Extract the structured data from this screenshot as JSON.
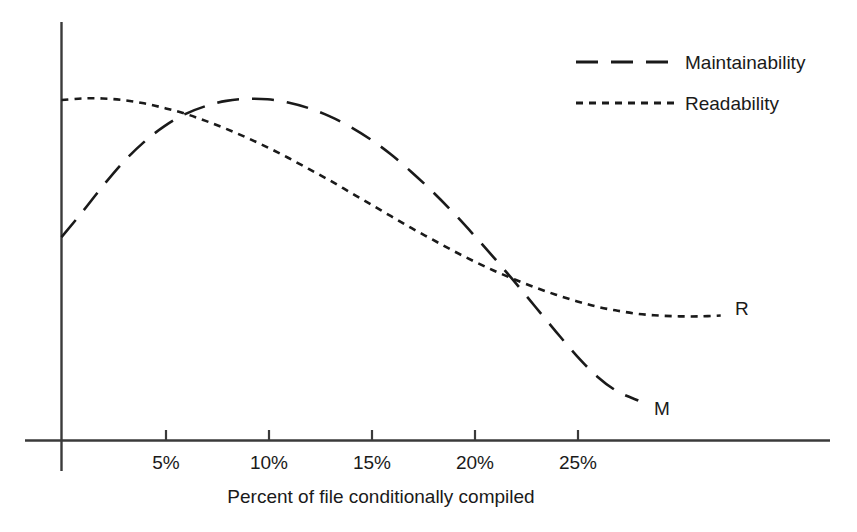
{
  "chart_data": {
    "type": "line",
    "title": "",
    "subtitle": "",
    "xlabel": "Percent of file conditionally compiled",
    "ylabel": "",
    "grid": false,
    "legend_position": "top-right",
    "xlim": [
      0,
      30
    ],
    "ylim": [
      0,
      100
    ],
    "xticks": [
      5,
      10,
      15,
      20,
      25
    ],
    "xticklabels": [
      "5%",
      "10%",
      "15%",
      "20%",
      "25%"
    ],
    "yticks": [],
    "yticklabels": [],
    "annotations": [
      {
        "text": "M",
        "series": "Maintainability",
        "x": 28.5,
        "y": 9
      },
      {
        "text": "R",
        "series": "Readability",
        "x": 32.5,
        "y": 32
      }
    ],
    "series": [
      {
        "name": "Maintainability",
        "short_label": "M",
        "dash": "long-dash",
        "color": "#1a1a1a",
        "x": [
          0.0,
          1.0,
          2.0,
          3.0,
          4.0,
          5.0,
          6.0,
          7.0,
          8.0,
          9.0,
          10.0,
          11.0,
          12.0,
          13.0,
          14.0,
          15.0,
          16.0,
          17.0,
          18.0,
          19.0,
          20.0,
          21.0,
          22.0,
          23.0,
          24.0,
          25.0,
          26.0,
          27.0,
          28.0
        ],
        "y": [
          50.8,
          57.0,
          63.5,
          69.5,
          74.5,
          78.5,
          81.5,
          83.5,
          84.8,
          85.3,
          85.2,
          84.4,
          83.0,
          81.0,
          78.4,
          75.2,
          71.4,
          67.0,
          62.2,
          57.0,
          51.4,
          45.6,
          39.6,
          33.4,
          27.2,
          21.2,
          16.0,
          12.2,
          10.0
        ]
      },
      {
        "name": "Readability",
        "short_label": "R",
        "dash": "short-dash",
        "color": "#1a1a1a",
        "x": [
          0.0,
          1.0,
          2.0,
          3.0,
          4.0,
          5.0,
          6.0,
          7.0,
          8.0,
          9.0,
          10.0,
          11.0,
          12.0,
          13.0,
          14.0,
          15.0,
          16.0,
          17.0,
          18.0,
          19.0,
          20.0,
          21.0,
          22.0,
          23.0,
          24.0,
          25.0,
          26.0,
          27.0,
          28.0,
          29.0,
          30.0,
          31.0,
          32.0
        ],
        "y": [
          85.0,
          85.4,
          85.4,
          85.0,
          84.2,
          83.0,
          81.6,
          79.8,
          77.8,
          75.6,
          73.2,
          70.6,
          67.8,
          65.0,
          62.0,
          59.0,
          56.0,
          53.0,
          50.2,
          47.4,
          44.8,
          42.4,
          40.2,
          38.2,
          36.4,
          34.8,
          33.4,
          32.4,
          31.6,
          31.2,
          31.0,
          31.0,
          31.2
        ]
      }
    ]
  },
  "legend": {
    "entries": [
      {
        "label": "Maintainability",
        "style": "long-dash"
      },
      {
        "label": "Readability",
        "style": "short-dash"
      }
    ]
  },
  "axes": {
    "x_axis_label": "Percent of file conditionally compiled",
    "x_tick_labels": [
      "5%",
      "10%",
      "15%",
      "20%",
      "25%"
    ]
  },
  "series_labels": {
    "maintainability_end": "M",
    "readability_end": "R"
  },
  "colors": {
    "line": "#1a1a1a",
    "axis": "#3a3a3a",
    "background": "#ffffff",
    "text": "#1a1a1a"
  }
}
